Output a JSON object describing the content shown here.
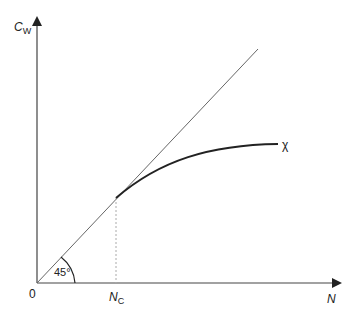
{
  "diagram": {
    "y_axis_label": "C",
    "y_axis_subscript": "W",
    "x_axis_label": "N",
    "origin_label": "0",
    "critical_label": "N",
    "critical_subscript": "C",
    "angle_label": "45°",
    "curve_label": "χ"
  },
  "colors": {
    "axis": "#333333",
    "line": "#555555",
    "curve": "#222222",
    "dashed": "#999999"
  }
}
